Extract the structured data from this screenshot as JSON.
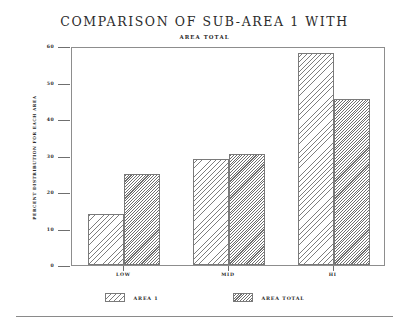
{
  "chart_data": {
    "type": "bar",
    "title": "COMPARISON OF SUB-AREA 1 WITH",
    "subtitle": "AREA TOTAL",
    "xlabel": "",
    "ylabel": "PERCENT DISTRIBUTION FOR EACH AREA",
    "categories": [
      "LOW",
      "MID",
      "HI"
    ],
    "series": [
      {
        "name": "AREA 1",
        "values": [
          14,
          29,
          58
        ],
        "hatch": "sparse-diagonal"
      },
      {
        "name": "AREA TOTAL",
        "values": [
          25,
          30.5,
          45.5
        ],
        "hatch": "dense-diagonal"
      }
    ],
    "ylim": [
      0,
      60
    ],
    "yticks": [
      0,
      10,
      20,
      30,
      40,
      50,
      60
    ],
    "ytick_labels": [
      "0",
      "10",
      "20",
      "30",
      "40",
      "50",
      "60"
    ],
    "grid": false,
    "legend_position": "bottom-center",
    "colors": {
      "axis": "#8d8d8d",
      "hatch": "#7a7a7a",
      "text": "#2b2b2b",
      "background": "#ffffff"
    }
  },
  "legend": {
    "entries": [
      {
        "label": "AREA 1"
      },
      {
        "label": "AREA TOTAL"
      }
    ]
  }
}
